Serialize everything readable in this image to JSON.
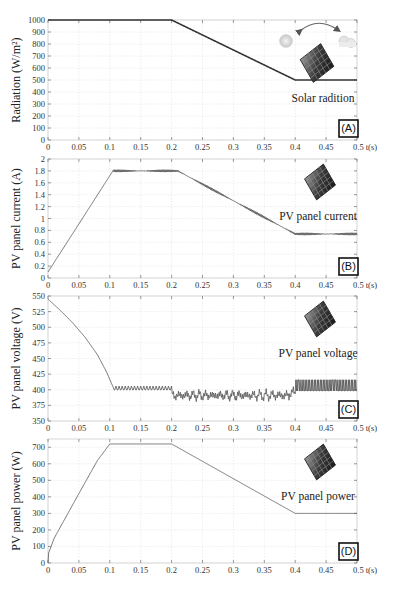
{
  "figure": {
    "caption": ""
  },
  "chart_data": [
    {
      "id": "A",
      "type": "line",
      "badge": "(A)",
      "title": "",
      "annotation": "Solar radition",
      "xlabel": "t(s)",
      "ylabel": "Radiation (W/m²)",
      "xlim": [
        0,
        0.5
      ],
      "ylim": [
        0,
        1000
      ],
      "xticks": [
        0,
        0.05,
        0.1,
        0.15,
        0.2,
        0.25,
        0.3,
        0.35,
        0.4,
        0.45,
        0.5
      ],
      "xtick_labels": [
        "0",
        "0.05",
        "0.1",
        "0.15",
        "0.2",
        "0.25",
        "0.3",
        "0.35",
        "0.4",
        "0.45",
        "0.5 t(s)"
      ],
      "yticks": [
        0,
        100,
        200,
        300,
        400,
        500,
        600,
        700,
        800,
        900,
        1000
      ],
      "grid": true,
      "series": [
        {
          "name": "Radiation",
          "x": [
            0,
            0.2,
            0.4,
            0.5
          ],
          "y": [
            1000,
            1000,
            500,
            500
          ],
          "ripple": 0
        }
      ],
      "icons": [
        "sun-icon",
        "cloud-icon",
        "arrow-arc-icon",
        "solar-panel-icon"
      ]
    },
    {
      "id": "B",
      "type": "line",
      "badge": "(B)",
      "annotation": "PV panel current",
      "xlabel": "t(s)",
      "ylabel": "PV panel current (A)",
      "xlim": [
        0,
        0.5
      ],
      "ylim": [
        0,
        2
      ],
      "xticks": [
        0,
        0.05,
        0.1,
        0.15,
        0.2,
        0.25,
        0.3,
        0.35,
        0.4,
        0.45,
        0.5
      ],
      "xtick_labels": [
        "0",
        "0.05",
        "0.1",
        "0.15",
        "0.2",
        "0.25",
        "0.3",
        "0.35",
        "0.4",
        "0.45",
        "0.5 t(s)"
      ],
      "yticks": [
        0,
        0.2,
        0.4,
        0.6,
        0.8,
        1,
        1.2,
        1.4,
        1.6,
        1.8,
        2
      ],
      "ytick_labels": [
        "0",
        "0.2",
        "0.4",
        "0.6",
        "0.8",
        "1",
        "1.2",
        "1.4",
        "1.6",
        "1.8",
        "2"
      ],
      "grid": true,
      "series": [
        {
          "name": "Current",
          "x": [
            0,
            0.105,
            0.21,
            0.4,
            0.5
          ],
          "y": [
            0.1,
            1.8,
            1.8,
            0.74,
            0.74
          ],
          "ripple": 0.02
        }
      ],
      "icons": [
        "solar-panel-icon"
      ]
    },
    {
      "id": "C",
      "type": "line",
      "badge": "(C)",
      "annotation": "PV panel voltage",
      "xlabel": "t(s)",
      "ylabel": "PV panel voltage (V)",
      "xlim": [
        0,
        0.5
      ],
      "ylim": [
        350,
        550
      ],
      "xticks": [
        0,
        0.05,
        0.1,
        0.15,
        0.2,
        0.25,
        0.3,
        0.35,
        0.4,
        0.45,
        0.5
      ],
      "xtick_labels": [
        "0",
        "0.05",
        "0.1",
        "0.15",
        "0.2",
        "0.25",
        "0.3",
        "0.35",
        "0.4",
        "0.45",
        "0.5 t(s)"
      ],
      "yticks": [
        350,
        375,
        400,
        425,
        450,
        475,
        500,
        525,
        550
      ],
      "grid": true,
      "series": [
        {
          "name": "Voltage",
          "x": [
            0,
            0.02,
            0.04,
            0.06,
            0.08,
            0.095,
            0.105,
            0.2,
            0.4,
            0.5
          ],
          "y": [
            545,
            527,
            507,
            484,
            456,
            428,
            405,
            402,
            395,
            407
          ],
          "segments": [
            {
              "x0": 0.105,
              "x1": 0.2,
              "center": 402,
              "amp": 4,
              "style": "sawtooth"
            },
            {
              "x0": 0.2,
              "x1": 0.4,
              "center": 393,
              "amp": 8,
              "style": "noise"
            },
            {
              "x0": 0.4,
              "x1": 0.5,
              "center": 407,
              "amp": 10,
              "style": "square"
            }
          ]
        }
      ],
      "icons": [
        "solar-panel-icon"
      ]
    },
    {
      "id": "D",
      "type": "line",
      "badge": "(D)",
      "annotation": "PV panel power",
      "xlabel": "t(s)",
      "ylabel": "PV panel power (W)",
      "xlim": [
        0,
        0.5
      ],
      "ylim": [
        0,
        750
      ],
      "xticks": [
        0,
        0.05,
        0.1,
        0.15,
        0.2,
        0.25,
        0.3,
        0.35,
        0.4,
        0.45,
        0.5
      ],
      "xtick_labels": [
        "0",
        "0.05",
        "0.1",
        "0.15",
        "0.2",
        "0.25",
        "0.3",
        "0.35",
        "0.4",
        "0.45",
        "0.5 t(s)"
      ],
      "yticks": [
        0,
        100,
        200,
        300,
        400,
        500,
        600,
        700
      ],
      "grid": true,
      "series": [
        {
          "name": "Power",
          "x": [
            0,
            0.001,
            0.01,
            0.05,
            0.08,
            0.1,
            0.2,
            0.4,
            0.5
          ],
          "y": [
            0,
            60,
            150,
            420,
            620,
            720,
            720,
            300,
            300
          ],
          "ripple": 0
        }
      ],
      "icons": [
        "solar-panel-icon"
      ]
    }
  ]
}
